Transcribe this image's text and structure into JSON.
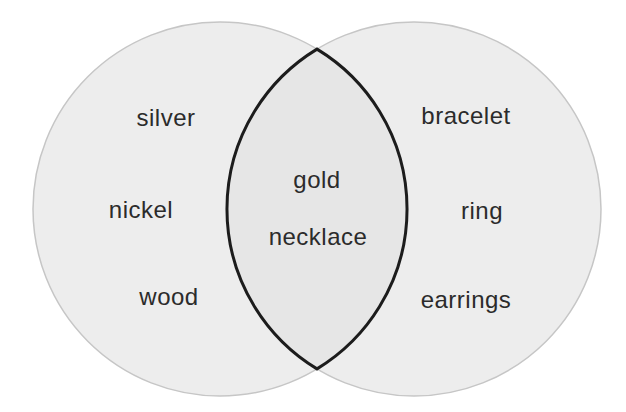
{
  "diagram": {
    "type": "venn",
    "left_set": {
      "items": [
        "silver",
        "nickel",
        "wood"
      ]
    },
    "right_set": {
      "items": [
        "bracelet",
        "ring",
        "earrings"
      ]
    },
    "intersection": {
      "items": [
        "gold",
        "necklace"
      ]
    },
    "colors": {
      "background": "#ffffff",
      "circle_fill": "#ededed",
      "circle_edge": "#c6c6c6",
      "intersection_fill": "#e6e6e6",
      "intersection_stroke": "#1c1c1c",
      "text": "#2b2b2b"
    }
  }
}
